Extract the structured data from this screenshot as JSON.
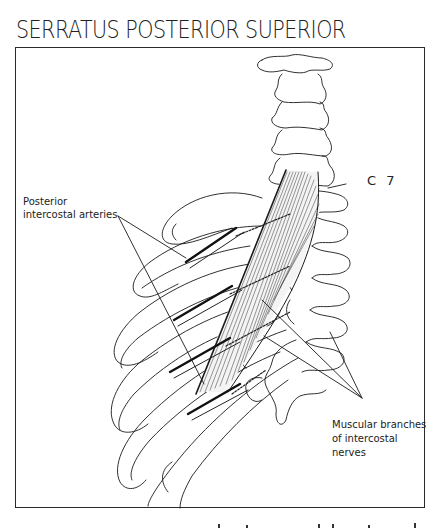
{
  "figure": {
    "title": "SERRATUS POSTERIOR SUPERIOR",
    "labels": {
      "arteries_line1": "Posterior",
      "arteries_line2": "intercostal arteries",
      "vertebra": "C 7",
      "nerves_line1": "Muscular branches",
      "nerves_line2": "of intercostal",
      "nerves_line3": "nerves"
    },
    "colors": {
      "ink": "#1a1a1a",
      "background": "#ffffff",
      "frame": "#2a2a2a"
    }
  }
}
